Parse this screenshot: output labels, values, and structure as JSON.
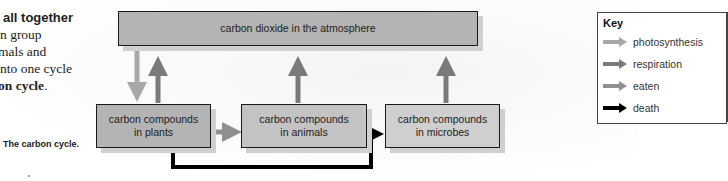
{
  "intro_text": {
    "lines": [
      {
        "text": "all together",
        "bold": true
      },
      {
        "text": "n group",
        "bold": false
      },
      {
        "text": "mals and",
        "bold": false
      },
      {
        "text": "nto one cycle",
        "bold": false
      },
      {
        "text": "on cycle",
        "bold": true,
        "suffix": "."
      }
    ]
  },
  "caption": "The carbon cycle.",
  "diagram": {
    "atmosphere": "carbon dioxide in the atmosphere",
    "plants": {
      "line1": "carbon compounds",
      "line2": "in plants"
    },
    "animals": {
      "line1": "carbon compounds",
      "line2": "in animals"
    },
    "microbes": {
      "line1": "carbon compounds",
      "line2": "in microbes"
    }
  },
  "key": {
    "title": "Key",
    "items": [
      {
        "label": "photosynthesis",
        "color": "#a8a8a8"
      },
      {
        "label": "respiration",
        "color": "#7a7a7a"
      },
      {
        "label": "eaten",
        "color": "#909090"
      },
      {
        "label": "death",
        "color": "#000000"
      }
    ]
  },
  "colors": {
    "photosynthesis": "#a8a8a8",
    "respiration": "#7a7a7a",
    "eaten": "#909090",
    "death": "#000000",
    "box_fill": "#b4b4b4"
  }
}
